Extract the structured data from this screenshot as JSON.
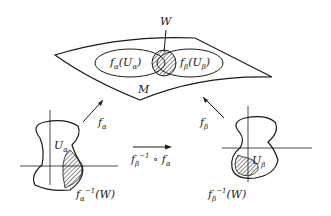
{
  "diagram": {
    "labels": {
      "W": "W",
      "M": "M",
      "fa_Ua": {
        "f": "f",
        "sub": "α",
        "open": "(U",
        "inner_sub": "α",
        "close": ")"
      },
      "fb_Ub": {
        "f": "f",
        "sub": "β",
        "open": "(U",
        "inner_sub": "β",
        "close": ")"
      },
      "f_alpha": {
        "f": "f",
        "sub": "α"
      },
      "f_beta": {
        "f": "f",
        "sub": "β"
      },
      "U_alpha": {
        "U": "U",
        "sub": "α"
      },
      "U_beta": {
        "U": "U",
        "sub": "β"
      },
      "transition": {
        "f": "f",
        "sub": "β",
        "sup": "−1",
        "op": " ∘ f",
        "sub2": "α"
      },
      "fa_inv_W": {
        "f": "f",
        "sub": "α",
        "sup": "−1",
        "arg": "(W)"
      },
      "fb_inv_W": {
        "f": "f",
        "sub": "β",
        "sup": "−1",
        "arg": "(W)"
      }
    },
    "colors": {
      "stroke": "#1a1a1a",
      "hatch": "#1a1a1a",
      "background": "#ffffff"
    }
  }
}
